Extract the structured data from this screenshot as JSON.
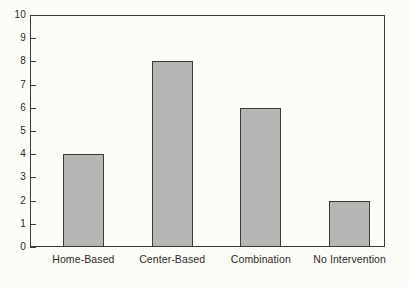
{
  "chart_data": {
    "type": "bar",
    "title": "",
    "subtitle": "",
    "xlabel": "",
    "ylabel": "",
    "categories": [
      "Home-Based",
      "Center-Based",
      "Combination",
      "No Intervention"
    ],
    "values": [
      4,
      8,
      6,
      2
    ],
    "ylim": [
      0,
      10
    ],
    "yticks": [
      0,
      1,
      2,
      3,
      4,
      5,
      6,
      7,
      8,
      9,
      10
    ],
    "ytick_labels": [
      "0",
      "1",
      "2",
      "3",
      "4",
      "5",
      "6",
      "7",
      "8",
      "9",
      "10"
    ],
    "grid": false,
    "legend": false,
    "legend_position": "none",
    "annotations": [],
    "colors": {
      "bar_fill": "#b6b6b4",
      "bar_edge": "#3a3a38",
      "axis": "#3a3a38",
      "text": "#2b2b29",
      "background": "#fdfdf8"
    }
  }
}
